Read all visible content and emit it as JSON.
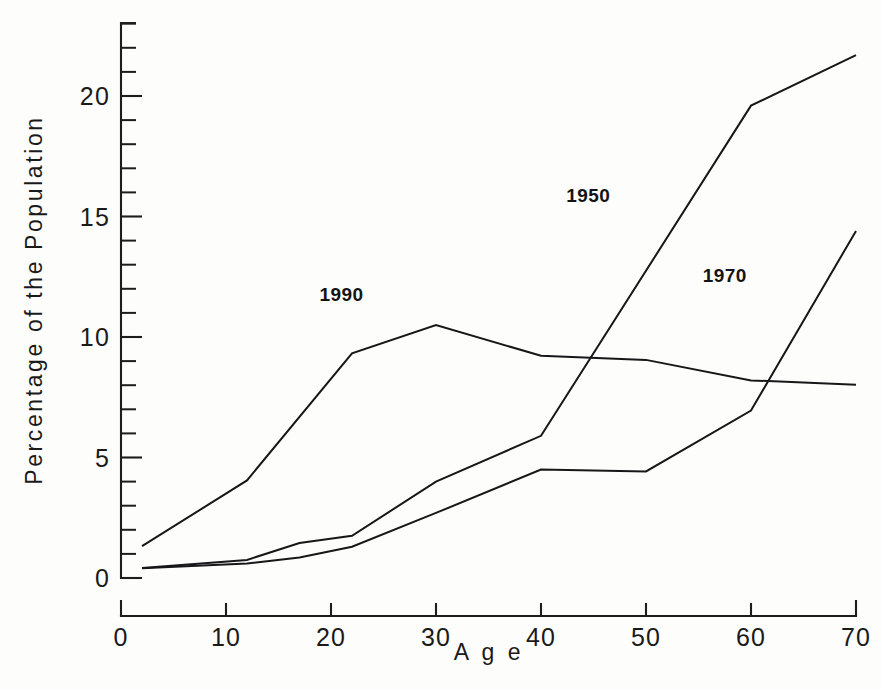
{
  "chart_data": {
    "type": "line",
    "title": "",
    "subtitle": "",
    "xlabel": "A g e",
    "ylabel": "Percentage of the Population",
    "xlim": [
      0,
      70
    ],
    "ylim": [
      0,
      23.7
    ],
    "grid": false,
    "legend_position": "inline-annotations",
    "x_ticks": [
      0,
      10,
      20,
      30,
      40,
      50,
      60,
      70
    ],
    "x_tick_labels": [
      "0",
      "10",
      "20",
      "30",
      "40",
      "50",
      "60",
      "70"
    ],
    "y_ticks": [
      0,
      5,
      10,
      15,
      20
    ],
    "y_tick_labels": [
      "0",
      "5",
      "10",
      "15",
      "20"
    ],
    "y_minor_tick_interval": 1,
    "series": [
      {
        "name": "1950",
        "label": "1950",
        "label_x": 44.5,
        "label_y": 15.6,
        "x": [
          2,
          12,
          17,
          22,
          30,
          40,
          60,
          70
        ],
        "values": [
          0.42,
          0.75,
          1.45,
          1.75,
          4.0,
          5.9,
          19.6,
          21.7
        ]
      },
      {
        "name": "1970",
        "label": "1970",
        "label_x": 57.5,
        "label_y": 12.3,
        "x": [
          2,
          12,
          17,
          22,
          30,
          40,
          50,
          60,
          70
        ],
        "values": [
          0.4,
          0.6,
          0.85,
          1.3,
          2.7,
          4.5,
          4.42,
          6.95,
          14.4
        ]
      },
      {
        "name": "1990",
        "label": "1990",
        "label_x": 21.0,
        "label_y": 11.5,
        "x": [
          2,
          12,
          22,
          30,
          40,
          50,
          60,
          70
        ],
        "values": [
          1.32,
          4.05,
          9.32,
          10.5,
          9.22,
          9.05,
          8.2,
          8.02
        ]
      }
    ],
    "annotations": [
      {
        "text": "1950",
        "x": 44.5,
        "y": 15.6
      },
      {
        "text": "1970",
        "x": 57.5,
        "y": 12.3
      },
      {
        "text": "1990",
        "x": 21.0,
        "y": 11.5
      }
    ],
    "colors": {
      "line": "#17171a",
      "axis": "#1d1d1d",
      "text": "#1a1a1a",
      "background": "#fdfdfc"
    }
  }
}
